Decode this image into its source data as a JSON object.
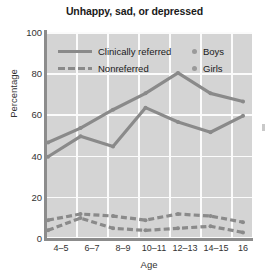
{
  "chart_data": {
    "type": "line",
    "title": "Unhappy, sad, or depressed",
    "xlabel": "Age",
    "ylabel": "Percentage",
    "categories": [
      "4–5",
      "6–7",
      "8–9",
      "10–11",
      "12–13",
      "14–15",
      "16"
    ],
    "ylim": [
      0,
      100
    ],
    "yticks": [
      0,
      20,
      40,
      60,
      80,
      100
    ],
    "ytick_labels": [
      "0",
      "20",
      "40",
      "60",
      "80",
      "100"
    ],
    "grid": true,
    "legend_position": "upper-left-inside",
    "legend": [
      {
        "label": "Clinically referred",
        "style": "solid"
      },
      {
        "label": "Nonreferred",
        "style": "dashed"
      },
      {
        "label": "Boys",
        "style": "dot"
      },
      {
        "label": "Girls",
        "style": "dot"
      }
    ],
    "series": [
      {
        "name": "Clinically referred – Boys",
        "style": "solid",
        "values": [
          46,
          53,
          62,
          70,
          80,
          70,
          66
        ]
      },
      {
        "name": "Clinically referred – Girls",
        "style": "solid",
        "values": [
          39,
          49,
          44,
          63,
          56,
          51,
          59
        ]
      },
      {
        "name": "Nonreferred – Boys",
        "style": "dashed",
        "values": [
          8,
          11,
          10,
          8,
          11,
          10,
          7
        ]
      },
      {
        "name": "Nonreferred – Girls",
        "style": "dashed",
        "values": [
          3,
          9,
          4,
          3,
          4,
          5,
          2
        ]
      }
    ],
    "colors": {
      "line": "#8a8a8a",
      "plot_background": "#d4d4d4",
      "gridline": "#fbfbfb",
      "axis": "#8c8c8c",
      "text": "#1a1a1a"
    }
  }
}
